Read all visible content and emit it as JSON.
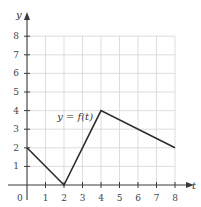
{
  "chart_data": {
    "type": "line",
    "title": "",
    "xlabel": "t",
    "ylabel": "y",
    "xlim": [
      0,
      8
    ],
    "ylim": [
      0,
      8
    ],
    "grid": true,
    "x_ticks": [
      1,
      2,
      3,
      4,
      5,
      6,
      7,
      8
    ],
    "y_ticks": [
      1,
      2,
      3,
      4,
      5,
      6,
      7,
      8
    ],
    "origin_label": "0",
    "series": [
      {
        "name": "y = f(t)",
        "points": [
          [
            0,
            2
          ],
          [
            2,
            0
          ],
          [
            4,
            4
          ],
          [
            8,
            2
          ]
        ]
      }
    ],
    "annotations": [
      {
        "text": "y = f(t)",
        "near": [
          2.6,
          3.5
        ]
      }
    ]
  }
}
